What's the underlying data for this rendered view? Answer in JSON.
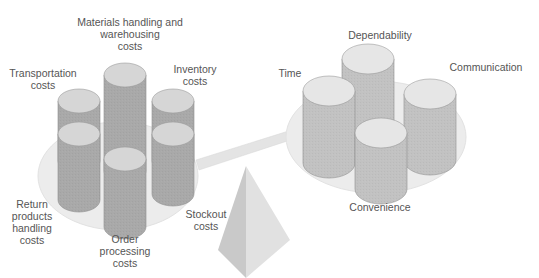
{
  "diagram": {
    "colors": {
      "cost_cylinder_body": "#a9a9a9",
      "cost_cylinder_top": "#d6d6d6",
      "service_cylinder_body": "#c2c2c2",
      "service_cylinder_top": "#e6e6e6",
      "plate": "#ececec",
      "beam": "#e2e2e2",
      "fulcrum_light": "#d8d8d8",
      "fulcrum_dark": "#bdbdbd",
      "text": "#555555"
    },
    "cost_side": {
      "labels": {
        "materials": "Materials handling and\nwarehousing\ncosts",
        "transportation": "Transportation\ncosts",
        "inventory": "Inventory\ncosts",
        "return_products": "Return\nproducts\nhandling\ncosts",
        "order_processing": "Order\nprocessing\ncosts",
        "stockout": "Stockout\ncosts"
      }
    },
    "service_side": {
      "labels": {
        "dependability": "Dependability",
        "time": "Time",
        "communication": "Communication",
        "convenience": "Convenience"
      }
    }
  }
}
